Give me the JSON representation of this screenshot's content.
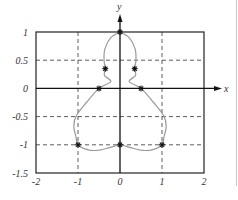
{
  "chart_data": {
    "type": "line",
    "title": "",
    "xlabel": "x",
    "ylabel": "y",
    "xlim": [
      -2,
      2
    ],
    "ylim": [
      -1.5,
      1
    ],
    "grid": true,
    "grid_style": "dashed",
    "x_ticks": [
      "-2",
      "-1",
      "0",
      "1",
      "2"
    ],
    "y_ticks": [
      "1",
      "0.5",
      "0",
      "-0.5",
      "-1",
      "-1.5"
    ],
    "curve_color": "#9a9a9a",
    "series": [
      {
        "name": "closed curve",
        "points": [
          [
            0,
            1
          ],
          [
            0.22,
            0.9
          ],
          [
            0.36,
            0.7
          ],
          [
            0.38,
            0.5
          ],
          [
            0.35,
            0.35
          ],
          [
            0.37,
            0.23
          ],
          [
            0.22,
            0.12
          ],
          [
            0.5,
            0
          ],
          [
            0.8,
            -0.25
          ],
          [
            1.05,
            -0.5
          ],
          [
            1.1,
            -0.68
          ],
          [
            1.05,
            -0.85
          ],
          [
            1.0,
            -1.0
          ],
          [
            0.8,
            -1.08
          ],
          [
            0.55,
            -1.1
          ],
          [
            0.25,
            -1.05
          ],
          [
            0,
            -1.0
          ],
          [
            -0.25,
            -1.05
          ],
          [
            -0.55,
            -1.1
          ],
          [
            -0.8,
            -1.08
          ],
          [
            -1.0,
            -1.0
          ],
          [
            -1.05,
            -0.85
          ],
          [
            -1.1,
            -0.68
          ],
          [
            -1.05,
            -0.5
          ],
          [
            -0.8,
            -0.25
          ],
          [
            -0.5,
            0
          ],
          [
            -0.22,
            0.12
          ],
          [
            -0.37,
            0.23
          ],
          [
            -0.35,
            0.35
          ],
          [
            -0.38,
            0.5
          ],
          [
            -0.36,
            0.7
          ],
          [
            -0.22,
            0.9
          ],
          [
            0,
            1
          ]
        ]
      }
    ],
    "markers": {
      "symbol": "asterisk",
      "points": [
        [
          0,
          1
        ],
        [
          0.35,
          0.35
        ],
        [
          -0.35,
          0.35
        ],
        [
          0.5,
          0
        ],
        [
          -0.5,
          0
        ],
        [
          1,
          -1
        ],
        [
          -1,
          -1
        ],
        [
          0,
          -1
        ]
      ]
    }
  }
}
